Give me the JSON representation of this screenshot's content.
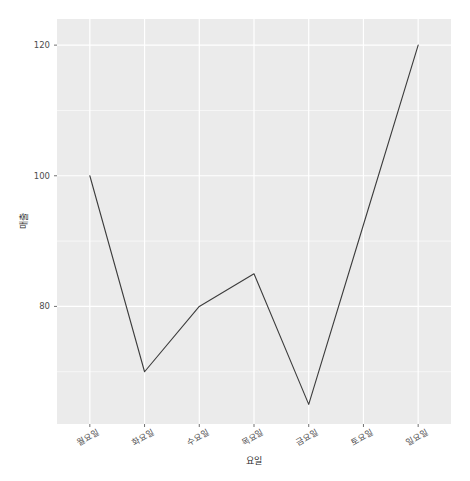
{
  "chart_data": {
    "type": "line",
    "title": "",
    "subtitle": "",
    "xlabel": "요일",
    "ylabel": "매출",
    "categories": [
      "월요일",
      "화요일",
      "수요일",
      "목요일",
      "금요일",
      "토요일",
      "일요일"
    ],
    "values": [
      100,
      70,
      80,
      85,
      65,
      92.5,
      120
    ],
    "series": [
      {
        "name": "매출",
        "values": [
          100,
          70,
          80,
          85,
          65,
          92.5,
          120
        ]
      }
    ],
    "y_ticks": [
      80,
      100,
      120
    ],
    "y_tick_labels": [
      "80",
      "100",
      "120"
    ],
    "ylim": [
      62,
      124
    ],
    "grid": true,
    "grid_major": true,
    "grid_minor": true,
    "legend": "none",
    "panel_background": "#EBEBEB",
    "grid_color": "#FFFFFF",
    "line_color": "#3C3C3C",
    "line_width": 1.1,
    "markers": false,
    "annotations": []
  },
  "axes": {
    "y": {
      "title": "매출",
      "ticks": [
        {
          "value": 120,
          "label": "120"
        },
        {
          "value": 100,
          "label": "100"
        },
        {
          "value": 80,
          "label": "80"
        }
      ]
    },
    "x": {
      "title": "요일",
      "ticks": [
        {
          "label": "월요일"
        },
        {
          "label": "화요일"
        },
        {
          "label": "수요일"
        },
        {
          "label": "목요일"
        },
        {
          "label": "금요일"
        },
        {
          "label": "토요일"
        },
        {
          "label": "일요일"
        }
      ]
    }
  }
}
